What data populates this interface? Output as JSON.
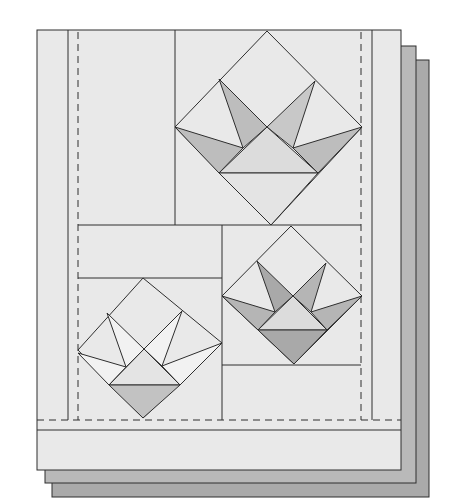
{
  "figure": {
    "colors": {
      "background": "#ffffff",
      "fabric": "#e9e9e9",
      "layer_mid": "#b9b9b9",
      "layer_back": "#aaaaaa",
      "line": "#2e2e2e",
      "petal_dark": "#bdbdbd",
      "petal_mid": "#c8c8c8",
      "basket_light": "#dcdcdc",
      "basket_dark": "#a9a9a9",
      "petal_white": "#f2f2f2"
    },
    "layers": [
      {
        "name": "back-layer",
        "x": 52,
        "y": 60,
        "w": 377,
        "h": 437
      },
      {
        "name": "middle-layer",
        "x": 45,
        "y": 46,
        "w": 371,
        "h": 437
      },
      {
        "name": "front-layer",
        "x": 37,
        "y": 30,
        "w": 364,
        "h": 440
      }
    ],
    "blocks": [
      {
        "name": "top-basket-block",
        "shade": "medium"
      },
      {
        "name": "right-basket-block",
        "shade": "dark"
      },
      {
        "name": "left-basket-block",
        "shade": "light"
      }
    ]
  }
}
